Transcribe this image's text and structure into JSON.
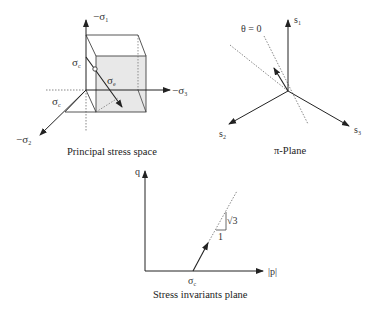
{
  "panels": {
    "principal_stress_space": {
      "caption": "Principal stress space",
      "axis_labels": {
        "sigma1": "−σ",
        "sigma1_sub": "1",
        "sigma2": "−σ",
        "sigma2_sub": "2",
        "sigma3": "−σ",
        "sigma3_sub": "3"
      },
      "labels": {
        "sigma_c_vertical": "σ",
        "sigma_c_vertical_sub": "c",
        "sigma_c_oblique": "σ",
        "sigma_c_oblique_sub": "c",
        "sigma_e": "σ",
        "sigma_e_sub": "e"
      }
    },
    "pi_plane": {
      "caption": "π-Plane",
      "theta_label": "θ = 0",
      "axis_labels": {
        "s1": "s",
        "s1_sub": "1",
        "s2": "s",
        "s2_sub": "2",
        "s3": "s",
        "s3_sub": "3"
      }
    },
    "stress_invariants_plane": {
      "caption": "Stress invariants plane",
      "y_axis_label": "q",
      "x_axis_label": "|p|",
      "origin_marker": "σ",
      "origin_marker_sub": "c",
      "slope_rise": "√3",
      "slope_run": "1"
    }
  },
  "colors": {
    "line": "#333333",
    "shade": "#e6e6e6",
    "dotted": "#555555"
  }
}
